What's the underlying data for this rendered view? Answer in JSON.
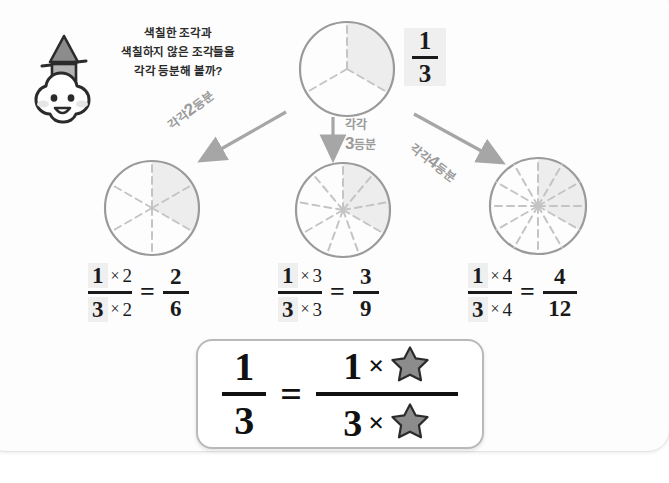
{
  "page": {
    "background_color": "#ffffff",
    "border_color": "#e3e3e3"
  },
  "mascot": {
    "name": "cloud-character-with-hat",
    "body_color": "#ffffff",
    "outline_color": "#2b2b2b",
    "cheek_color": "#e6e6e6",
    "hat_color": "#8c8c8c"
  },
  "speech": {
    "line1": "색칠한 조각과",
    "line2": "색칠하지 않은 조각들을",
    "line3": "각각 등분해 볼까?",
    "color": "#2b2b2b"
  },
  "top_circle": {
    "name": "circle-thirds",
    "total_parts": 3,
    "shaded_parts": 1,
    "fraction_numerator": "1",
    "fraction_denominator": "3",
    "stroke_color": "#9a9a9a",
    "shade_color": "#ededed",
    "divider_color": "#c4c4c4"
  },
  "arrows": {
    "left": {
      "label_prefix": "각각",
      "label_number": "2",
      "label_suffix": "등분",
      "direction": "down-left",
      "color": "#a6a6a6"
    },
    "middle": {
      "label_prefix": "각각",
      "label_number": "3",
      "label_suffix": "등분",
      "direction": "down",
      "color": "#a6a6a6"
    },
    "right": {
      "label_prefix": "각각",
      "label_number": "4",
      "label_suffix": "등분",
      "direction": "down-right",
      "color": "#a6a6a6"
    }
  },
  "results": [
    {
      "name": "result-sixths",
      "total_parts": 6,
      "shaded_parts": 2,
      "equation": {
        "num_base": "1",
        "num_op": "×",
        "num_factor": "2",
        "den_base": "3",
        "den_op": "×",
        "den_factor": "2",
        "equals": "=",
        "result_num": "2",
        "result_den": "6"
      }
    },
    {
      "name": "result-ninths",
      "total_parts": 9,
      "shaded_parts": 3,
      "equation": {
        "num_base": "1",
        "num_op": "×",
        "num_factor": "3",
        "den_base": "3",
        "den_op": "×",
        "den_factor": "3",
        "equals": "=",
        "result_num": "3",
        "result_den": "9"
      }
    },
    {
      "name": "result-twelfths",
      "total_parts": 12,
      "shaded_parts": 4,
      "equation": {
        "num_base": "1",
        "num_op": "×",
        "num_factor": "4",
        "den_base": "3",
        "den_op": "×",
        "den_factor": "4",
        "equals": "=",
        "result_num": "4",
        "result_den": "12"
      }
    }
  ],
  "result_box": {
    "name": "general-rule-box",
    "left_num": "1",
    "left_den": "3",
    "equals": "=",
    "right_num_base": "1",
    "right_num_op": "×",
    "right_num_star": "★",
    "right_den_base": "3",
    "right_den_op": "×",
    "right_den_star": "★",
    "star_color": "#8c8c8c",
    "border_color": "#b9b9b9"
  }
}
